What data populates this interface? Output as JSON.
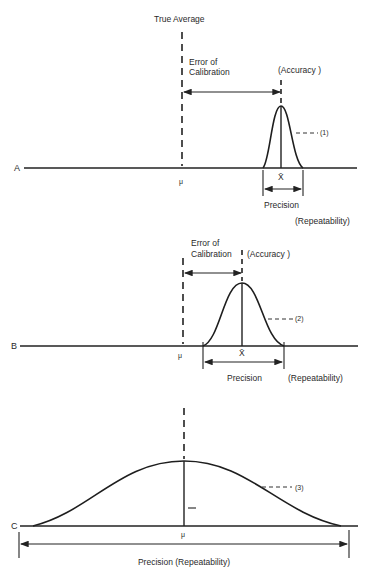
{
  "figure": {
    "title": "True Average",
    "panels": [
      {
        "id": "A",
        "axis_letter": "A",
        "mean_symbol": "μ",
        "sample_mean_symbol": "X̄",
        "error_label_line1": "Error of",
        "error_label_line2": "Calibration",
        "accuracy_label": "(Accuracy )",
        "curve_label": "(1)",
        "precision_label": "Precision",
        "repeatability_label": "(Repeatability)"
      },
      {
        "id": "B",
        "axis_letter": "B",
        "mean_symbol": "μ",
        "sample_mean_symbol": "X̄",
        "error_label_line1": "Error of",
        "error_label_line2": "Calibration",
        "accuracy_label": "(Accuracy )",
        "curve_label": "(2)",
        "precision_label": "Precision",
        "repeatability_label": "(Repeatability)"
      },
      {
        "id": "C",
        "axis_letter": "C",
        "mean_symbol": "μ",
        "curve_label": "(3)",
        "precision_label": "Precision (Repeatability)"
      }
    ]
  }
}
